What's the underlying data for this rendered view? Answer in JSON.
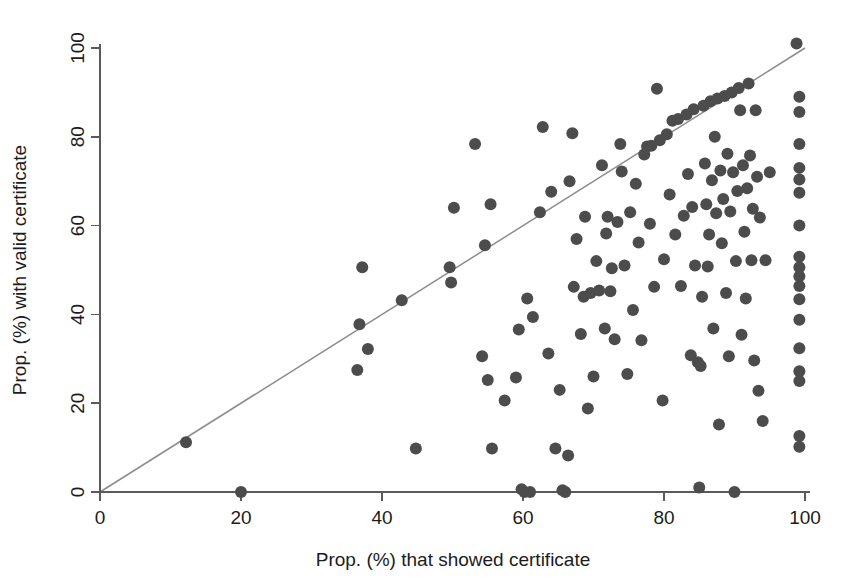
{
  "chart_data": {
    "type": "scatter",
    "title": "",
    "xlabel": "Prop. (%) that showed certificate",
    "ylabel": "Prop. (%) with valid certificate",
    "xlim": [
      0,
      100
    ],
    "ylim": [
      0,
      100
    ],
    "xticks": [
      0,
      20,
      40,
      60,
      80,
      100
    ],
    "yticks": [
      0,
      20,
      40,
      60,
      80,
      100
    ],
    "xtick_labels": [
      "0",
      "20",
      "40",
      "60",
      "80",
      "100"
    ],
    "ytick_labels": [
      "0",
      "20",
      "40",
      "60",
      "80",
      "100"
    ],
    "grid": false,
    "legend": null,
    "marker": {
      "shape": "circle",
      "color": "#4c4c4c",
      "radius_px": 6
    },
    "reference_line": {
      "description": "identity line y = x",
      "color": "#8c8c8c",
      "from": [
        0,
        0
      ],
      "to": [
        100,
        100
      ]
    },
    "points": [
      [
        12.2,
        11.2
      ],
      [
        20.0,
        0.0
      ],
      [
        36.5,
        27.5
      ],
      [
        36.8,
        37.8
      ],
      [
        37.2,
        50.6
      ],
      [
        38.0,
        32.2
      ],
      [
        42.8,
        43.2
      ],
      [
        44.8,
        9.8
      ],
      [
        49.6,
        50.6
      ],
      [
        49.8,
        47.2
      ],
      [
        50.2,
        64.0
      ],
      [
        53.2,
        78.4
      ],
      [
        54.2,
        30.6
      ],
      [
        54.6,
        55.6
      ],
      [
        55.0,
        25.2
      ],
      [
        55.4,
        64.8
      ],
      [
        55.6,
        9.8
      ],
      [
        57.4,
        20.6
      ],
      [
        59.0,
        25.8
      ],
      [
        59.4,
        36.6
      ],
      [
        59.8,
        0.6
      ],
      [
        60.2,
        0.0
      ],
      [
        60.6,
        43.6
      ],
      [
        61.0,
        0.0
      ],
      [
        61.4,
        39.4
      ],
      [
        62.4,
        63.0
      ],
      [
        62.8,
        82.2
      ],
      [
        63.6,
        31.2
      ],
      [
        64.0,
        67.6
      ],
      [
        64.6,
        9.8
      ],
      [
        65.2,
        23.0
      ],
      [
        65.6,
        0.4
      ],
      [
        66.0,
        0.0
      ],
      [
        66.4,
        8.2
      ],
      [
        66.6,
        70.0
      ],
      [
        67.0,
        80.8
      ],
      [
        67.2,
        46.2
      ],
      [
        67.6,
        57.0
      ],
      [
        68.2,
        35.6
      ],
      [
        68.6,
        44.0
      ],
      [
        68.8,
        62.0
      ],
      [
        69.2,
        18.8
      ],
      [
        69.6,
        44.8
      ],
      [
        70.0,
        26.0
      ],
      [
        70.4,
        52.0
      ],
      [
        70.8,
        45.4
      ],
      [
        71.2,
        73.6
      ],
      [
        71.6,
        36.8
      ],
      [
        71.8,
        58.2
      ],
      [
        72.0,
        62.0
      ],
      [
        72.4,
        45.2
      ],
      [
        72.6,
        50.4
      ],
      [
        73.0,
        34.4
      ],
      [
        73.4,
        60.8
      ],
      [
        73.8,
        78.4
      ],
      [
        74.0,
        72.2
      ],
      [
        74.4,
        51.0
      ],
      [
        74.8,
        26.6
      ],
      [
        75.2,
        63.0
      ],
      [
        75.6,
        41.0
      ],
      [
        76.0,
        69.4
      ],
      [
        76.4,
        56.2
      ],
      [
        76.8,
        34.2
      ],
      [
        77.2,
        76.0
      ],
      [
        77.6,
        77.8
      ],
      [
        78.0,
        60.4
      ],
      [
        78.2,
        78.0
      ],
      [
        78.6,
        46.2
      ],
      [
        79.0,
        90.8
      ],
      [
        79.4,
        79.2
      ],
      [
        79.8,
        20.6
      ],
      [
        80.0,
        52.4
      ],
      [
        80.4,
        80.6
      ],
      [
        80.8,
        67.0
      ],
      [
        81.2,
        83.6
      ],
      [
        81.6,
        58.0
      ],
      [
        82.0,
        84.0
      ],
      [
        82.4,
        46.4
      ],
      [
        82.8,
        62.2
      ],
      [
        83.2,
        85.0
      ],
      [
        83.4,
        71.6
      ],
      [
        83.8,
        30.8
      ],
      [
        84.0,
        64.2
      ],
      [
        84.2,
        86.2
      ],
      [
        84.4,
        51.0
      ],
      [
        84.8,
        29.2
      ],
      [
        85.0,
        1.0
      ],
      [
        85.2,
        28.4
      ],
      [
        85.4,
        44.0
      ],
      [
        85.6,
        87.0
      ],
      [
        85.8,
        74.0
      ],
      [
        86.0,
        64.8
      ],
      [
        86.2,
        50.8
      ],
      [
        86.4,
        58.0
      ],
      [
        86.6,
        88.0
      ],
      [
        86.8,
        70.2
      ],
      [
        87.0,
        36.8
      ],
      [
        87.2,
        80.0
      ],
      [
        87.4,
        62.8
      ],
      [
        87.6,
        88.6
      ],
      [
        87.8,
        15.2
      ],
      [
        88.0,
        72.4
      ],
      [
        88.2,
        56.0
      ],
      [
        88.4,
        66.0
      ],
      [
        88.6,
        89.2
      ],
      [
        88.8,
        44.8
      ],
      [
        89.0,
        76.2
      ],
      [
        89.2,
        30.6
      ],
      [
        89.4,
        63.2
      ],
      [
        89.6,
        90.0
      ],
      [
        89.8,
        72.0
      ],
      [
        90.0,
        0.0
      ],
      [
        90.2,
        52.0
      ],
      [
        90.4,
        67.8
      ],
      [
        90.6,
        91.0
      ],
      [
        90.8,
        86.0
      ],
      [
        91.0,
        35.4
      ],
      [
        91.2,
        73.6
      ],
      [
        91.4,
        58.6
      ],
      [
        91.6,
        43.6
      ],
      [
        91.8,
        68.4
      ],
      [
        92.0,
        92.0
      ],
      [
        92.2,
        75.8
      ],
      [
        92.4,
        52.2
      ],
      [
        92.6,
        63.8
      ],
      [
        92.8,
        29.6
      ],
      [
        93.0,
        86.0
      ],
      [
        93.2,
        71.0
      ],
      [
        93.4,
        22.8
      ],
      [
        93.6,
        61.8
      ],
      [
        94.0,
        16.0
      ],
      [
        94.4,
        52.2
      ],
      [
        95.0,
        72.0
      ],
      [
        98.8,
        101.0
      ],
      [
        99.2,
        89.0
      ],
      [
        99.2,
        85.6
      ],
      [
        99.2,
        78.4
      ],
      [
        99.2,
        73.0
      ],
      [
        99.2,
        70.4
      ],
      [
        99.2,
        67.4
      ],
      [
        99.2,
        60.0
      ],
      [
        99.2,
        53.0
      ],
      [
        99.2,
        50.6
      ],
      [
        99.2,
        48.6
      ],
      [
        99.2,
        46.4
      ],
      [
        99.2,
        43.4
      ],
      [
        99.2,
        38.8
      ],
      [
        99.2,
        32.4
      ],
      [
        99.2,
        27.2
      ],
      [
        99.2,
        25.0
      ],
      [
        99.2,
        12.6
      ],
      [
        99.2,
        10.2
      ]
    ]
  }
}
